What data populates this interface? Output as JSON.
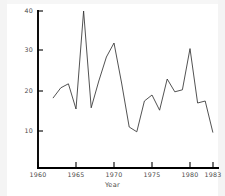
{
  "chart_data": {
    "type": "line",
    "title": "",
    "subtitle": "",
    "xlabel": "Year",
    "ylabel": "",
    "xlim": [
      1960,
      1984
    ],
    "ylim": [
      7,
      40
    ],
    "xticks": [
      1960,
      1965,
      1970,
      1975,
      1980,
      1983
    ],
    "xtick_labels": [
      "1960",
      "1965",
      "1970",
      "1975",
      "1980",
      "1983"
    ],
    "yticks": [
      10,
      20,
      30,
      40
    ],
    "ytick_labels": [
      "10",
      "20",
      "30",
      "40"
    ],
    "grid": false,
    "legend": "none",
    "line_color": "#333333",
    "background_color": "#ffffff",
    "axis_color": "#000000",
    "x": [
      1962,
      1963,
      1964,
      1965,
      1966,
      1967,
      1968,
      1969,
      1970,
      1971,
      1972,
      1973,
      1974,
      1975,
      1976,
      1977,
      1978,
      1979,
      1980,
      1981,
      1982,
      1983
    ],
    "values": [
      18.3,
      20.8,
      21.8,
      15.5,
      40.0,
      15.8,
      22.5,
      28.5,
      32.0,
      22.0,
      11.0,
      9.8,
      17.5,
      19.0,
      15.2,
      23.0,
      19.8,
      20.3,
      30.6,
      17.0,
      17.5,
      9.7
    ],
    "series": [
      {
        "name": "series-1",
        "values": [
          18.3,
          20.8,
          21.8,
          15.5,
          40.0,
          15.8,
          22.5,
          28.5,
          32.0,
          22.0,
          11.0,
          9.8,
          17.5,
          19.0,
          15.2,
          23.0,
          19.8,
          20.3,
          30.6,
          17.0,
          17.5,
          9.7
        ]
      }
    ]
  },
  "axes": {
    "x_title": "Year",
    "y_tick_labels": [
      "40",
      "30",
      "20",
      "10"
    ],
    "x_tick_labels": [
      "1960",
      "1965",
      "1970",
      "1975",
      "1980",
      "1983"
    ]
  }
}
